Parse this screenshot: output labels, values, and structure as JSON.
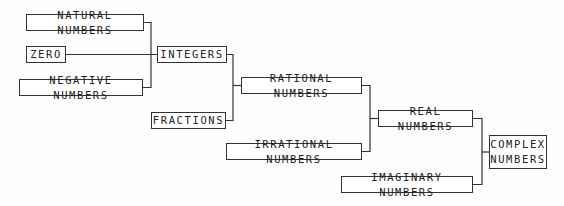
{
  "diagram": {
    "type": "number-systems-hierarchy",
    "nodes": [
      {
        "id": "natural",
        "label": "NATURAL NUMBERS",
        "x": 26,
        "y": 14,
        "w": 118,
        "h": 17
      },
      {
        "id": "zero",
        "label": "ZERO",
        "x": 26,
        "y": 46,
        "w": 40,
        "h": 17
      },
      {
        "id": "negative",
        "label": "NEGATIVE NUMBERS",
        "x": 19,
        "y": 79,
        "w": 124,
        "h": 17
      },
      {
        "id": "integers",
        "label": "INTEGERS",
        "x": 157,
        "y": 46,
        "w": 70,
        "h": 17
      },
      {
        "id": "fractions",
        "label": "FRACTIONS",
        "x": 151,
        "y": 112,
        "w": 75,
        "h": 17
      },
      {
        "id": "rational",
        "label": "RATIONAL NUMBERS",
        "x": 241,
        "y": 77,
        "w": 121,
        "h": 17
      },
      {
        "id": "irrational",
        "label": "IRRATIONAL NUMBERS",
        "x": 226,
        "y": 143,
        "w": 136,
        "h": 17
      },
      {
        "id": "real",
        "label": "REAL NUMBERS",
        "x": 378,
        "y": 110,
        "w": 95,
        "h": 17
      },
      {
        "id": "imaginary",
        "label": "IMAGINARY NUMBERS",
        "x": 341,
        "y": 176,
        "w": 132,
        "h": 17
      },
      {
        "id": "complex",
        "label": "COMPLEX\nNUMBERS",
        "x": 489,
        "y": 135,
        "w": 58,
        "h": 34
      }
    ],
    "edges": [
      {
        "from": [
          "natural",
          "zero",
          "negative"
        ],
        "to": "integers"
      },
      {
        "from": [
          "integers",
          "fractions"
        ],
        "to": "rational"
      },
      {
        "from": [
          "rational",
          "irrational"
        ],
        "to": "real"
      },
      {
        "from": [
          "real",
          "imaginary"
        ],
        "to": "complex"
      }
    ],
    "colors": {
      "line": "#333333",
      "box_border": "#333333",
      "text": "#222222",
      "background": "#fdfdfd"
    }
  }
}
